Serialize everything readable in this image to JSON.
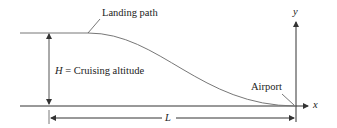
{
  "diagram": {
    "labels": {
      "landing_path": "Landing path",
      "altitude_var": "H",
      "altitude_text": " = Cruising altitude",
      "airport": "Airport",
      "distance": "L",
      "x_axis": "x",
      "y_axis": "y"
    },
    "colors": {
      "line": "#333333",
      "curve": "#777777",
      "text": "#222222"
    }
  }
}
